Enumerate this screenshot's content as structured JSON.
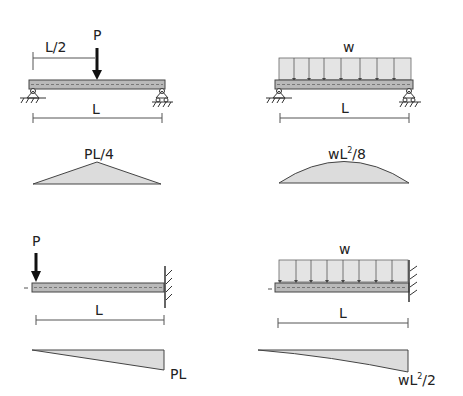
{
  "colors": {
    "beam_fill": "#b9b9b9",
    "load_fill": "#e4e4e4",
    "diagram_fill": "#dcdcdc",
    "stroke": "#333333"
  },
  "panels": [
    {
      "id": "simply-supported-point-load",
      "load_label": "P",
      "position_label": "L/2",
      "span_label": "L",
      "moment_label": "PL/4"
    },
    {
      "id": "simply-supported-udl",
      "load_label": "w",
      "span_label": "L",
      "moment_label_base": "wL",
      "moment_label_sup": "2",
      "moment_label_tail": "/8"
    },
    {
      "id": "cantilever-point-load",
      "load_label": "P",
      "span_label": "L",
      "moment_label": "PL"
    },
    {
      "id": "cantilever-udl",
      "load_label": "w",
      "span_label": "L",
      "moment_label_base": "wL",
      "moment_label_sup": "2",
      "moment_label_tail": "/2"
    }
  ]
}
